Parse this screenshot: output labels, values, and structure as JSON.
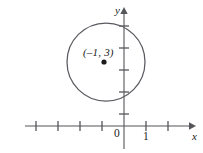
{
  "figure": {
    "background_color": "#ffffff",
    "stroke_color": "#55555a",
    "text_color": "#1b1b1b",
    "labels": {
      "point": "(–1, 3)",
      "origin": "0",
      "unit_x": "1",
      "x_axis": "x",
      "y_axis": "y"
    },
    "geometry": {
      "type": "circle",
      "center_label": "(–1, 3)",
      "center_x_units": -1,
      "center_y_units": 3,
      "radius_units": 1.8,
      "unit_spacing_px": 22,
      "origin_px": {
        "x": 124,
        "y": 126
      },
      "center_px": {
        "x": 104,
        "y": 62
      },
      "radius_px": 39
    },
    "axes": {
      "x_ticks_px": [
        36,
        58,
        80,
        102,
        146,
        168
      ],
      "y_ticks_px": [
        26,
        48,
        70,
        92,
        114
      ],
      "x_line": {
        "x1": 25,
        "y1": 126,
        "x2": 190,
        "y2": 126
      },
      "y_line": {
        "x1": 124,
        "y1": 12,
        "x2": 124,
        "y2": 148
      }
    }
  }
}
